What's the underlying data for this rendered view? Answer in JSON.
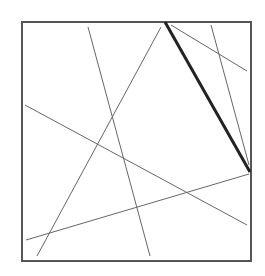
{
  "diagram": {
    "type": "line-arrangement-in-square",
    "frame": {
      "x": 22,
      "y": 22,
      "width": 229,
      "height": 239,
      "stroke": "#555555",
      "stroke_width": 2
    },
    "thin_stroke": "#666666",
    "thick_stroke": "#222222",
    "lines": [
      {
        "id": "line-a",
        "x1": 88,
        "y1": 27,
        "x2": 150,
        "y2": 256,
        "thick": false
      },
      {
        "id": "line-b",
        "x1": 161,
        "y1": 27,
        "x2": 37,
        "y2": 256,
        "thick": false
      },
      {
        "id": "line-c",
        "x1": 25,
        "y1": 105,
        "x2": 247,
        "y2": 225,
        "thick": false
      },
      {
        "id": "line-d",
        "x1": 26,
        "y1": 240,
        "x2": 249,
        "y2": 174,
        "thick": false
      },
      {
        "id": "line-e",
        "x1": 171,
        "y1": 25,
        "x2": 247,
        "y2": 71,
        "thick": false
      },
      {
        "id": "line-f",
        "x1": 211,
        "y1": 25,
        "x2": 249,
        "y2": 165,
        "thick": false
      },
      {
        "id": "line-thick",
        "x1": 165,
        "y1": 22,
        "x2": 250,
        "y2": 172,
        "thick": true
      }
    ]
  }
}
